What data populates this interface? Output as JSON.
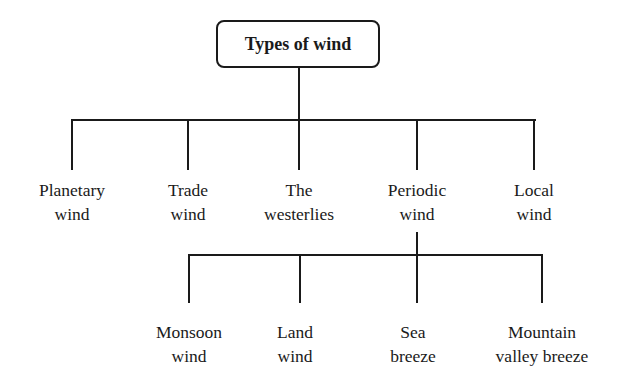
{
  "diagram": {
    "root": {
      "label": "Types of wind"
    },
    "level1": [
      {
        "line1": "Planetary",
        "line2": "wind"
      },
      {
        "line1": "Trade",
        "line2": "wind"
      },
      {
        "line1": "The",
        "line2": "westerlies"
      },
      {
        "line1": "Periodic",
        "line2": "wind"
      },
      {
        "line1": "Local",
        "line2": "wind"
      }
    ],
    "level2_parent": "Periodic wind",
    "level2": [
      {
        "line1": "Monsoon",
        "line2": "wind"
      },
      {
        "line1": "Land",
        "line2": "wind"
      },
      {
        "line1": "Sea",
        "line2": "breeze"
      },
      {
        "line1": "Mountain",
        "line2": "valley breeze"
      }
    ]
  }
}
